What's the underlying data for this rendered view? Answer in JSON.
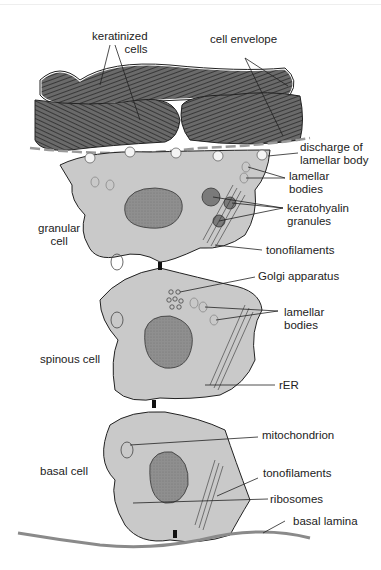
{
  "colors": {
    "cell_fill": "#c9c9c9",
    "nucleus_fill": "#8f8f8f",
    "keratin_fill": "#5a5a5a",
    "line": "#222222",
    "basal_lamina": "#8a8a8a"
  },
  "labels": {
    "keratinized_cells": [
      "keratinized",
      "cells"
    ],
    "cell_envelope": "cell envelope",
    "discharge": [
      "discharge of",
      "lamellar body"
    ],
    "lamellar_bodies_top": [
      "lamellar",
      "bodies"
    ],
    "keratohyalin": [
      "keratohyalin",
      "granules"
    ],
    "tonofilaments_top": "tonofilaments",
    "granular_cell": [
      "granular",
      "cell"
    ],
    "golgi": "Golgi apparatus",
    "lamellar_bodies_mid": [
      "lamellar",
      "bodies"
    ],
    "spinous_cell": "spinous cell",
    "rer": "rER",
    "mitochondrion": "mitochondrion",
    "basal_cell": "basal cell",
    "tonofilaments_bottom": "tonofilaments",
    "ribosomes": "ribosomes",
    "basal_lamina": "basal lamina"
  }
}
